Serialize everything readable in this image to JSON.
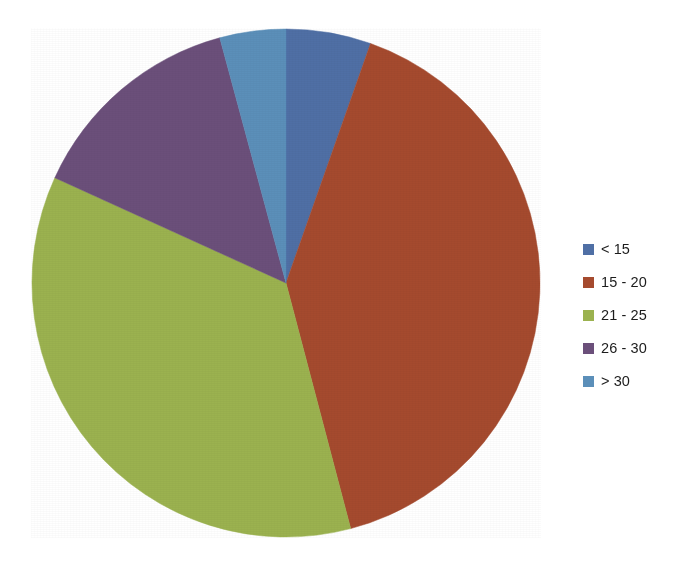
{
  "chart_data": {
    "type": "pie",
    "title": "",
    "subtitle": "",
    "xlabel": "",
    "ylabel": "",
    "grid": false,
    "legend_position": "right",
    "start_angle_deg": 0,
    "direction": "clockwise",
    "categories": [
      "< 15",
      "15 - 20",
      "21 - 25",
      "26 - 30",
      "> 30"
    ],
    "values": [
      5.4,
      40.5,
      35.9,
      14.0,
      4.2
    ],
    "value_unit": "percent",
    "angles_deg": [
      19.4,
      145.9,
      129.4,
      50.3,
      15.0
    ],
    "colors": [
      "#4F6FA5",
      "#A54A2E",
      "#9BB24F",
      "#6B4F7A",
      "#5B8FB9"
    ],
    "slices": [
      {
        "label": "< 15",
        "value": 5.4,
        "angle_deg": 19.4,
        "color": "#4F6FA5"
      },
      {
        "label": "15 - 20",
        "value": 40.5,
        "angle_deg": 145.9,
        "color": "#A54A2E"
      },
      {
        "label": "21 - 25",
        "value": 35.9,
        "angle_deg": 129.4,
        "color": "#9BB24F"
      },
      {
        "label": "26 - 30",
        "value": 14.0,
        "angle_deg": 50.3,
        "color": "#6B4F7A"
      },
      {
        "label": "> 30",
        "value": 4.2,
        "angle_deg": 15.0,
        "color": "#5B8FB9"
      }
    ]
  },
  "legend": {
    "items": [
      {
        "label": "< 15",
        "color": "#4F6FA5",
        "swatch_name": "legend-swatch-lt-15"
      },
      {
        "label": "15 - 20",
        "color": "#A54A2E",
        "swatch_name": "legend-swatch-15-20"
      },
      {
        "label": "21 - 25",
        "color": "#9BB24F",
        "swatch_name": "legend-swatch-21-25"
      },
      {
        "label": "26 - 30",
        "color": "#6B4F7A",
        "swatch_name": "legend-swatch-26-30"
      },
      {
        "label": "> 30",
        "color": "#5B8FB9",
        "swatch_name": "legend-swatch-gt-30"
      }
    ]
  },
  "canvas": {
    "background": "#ffffff",
    "pie_center_x": 286,
    "pie_center_y": 283,
    "pie_radius": 255
  }
}
